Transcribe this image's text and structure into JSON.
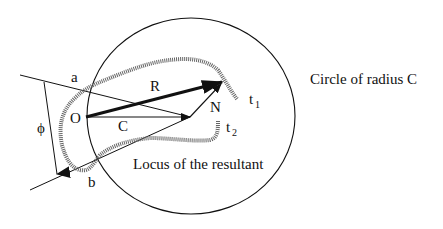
{
  "diagram": {
    "labels": {
      "a": "a",
      "b": "b",
      "O": "O",
      "C": "C",
      "R": "R",
      "N": "N",
      "phi": "ϕ",
      "t1_base": "t",
      "t1_sub": "1",
      "t2_base": "t",
      "t2_sub": "2"
    },
    "captions": {
      "circle": "Circle of radius C",
      "locus": "Locus of the resultant"
    },
    "colors": {
      "stroke": "#111111",
      "locus": "#555555",
      "background": "#ffffff"
    }
  }
}
